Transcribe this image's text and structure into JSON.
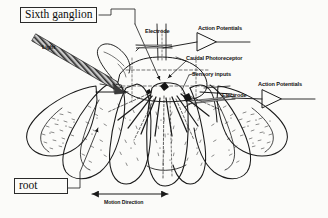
{
  "figure": {
    "background_color": "#fbfbf9",
    "ink_color": "#1a1a1a"
  },
  "boxed_labels": {
    "sixth_ganglion": "Sixth ganglion",
    "root": "root"
  },
  "annotations": {
    "light": "Light",
    "electrode_top": "Electrode",
    "electrode_right": "Electrode",
    "action_potentials_top": "Action Potentials",
    "action_potentials_right": "Action Potentials",
    "caudal_photoreceptor": "Caudal Photoreceptor",
    "sensory_inputs": "Sensory inputs",
    "motion_direction": "Motion Direction"
  },
  "icons": {
    "amplifier_top": "amplifier-triangle-icon",
    "amplifier_right": "amplifier-triangle-icon",
    "light_beam": "light-beam-arrow-icon",
    "motion_arrow": "double-headed-arrow-icon",
    "tail_fan": "crayfish-tail-fan-drawing"
  }
}
